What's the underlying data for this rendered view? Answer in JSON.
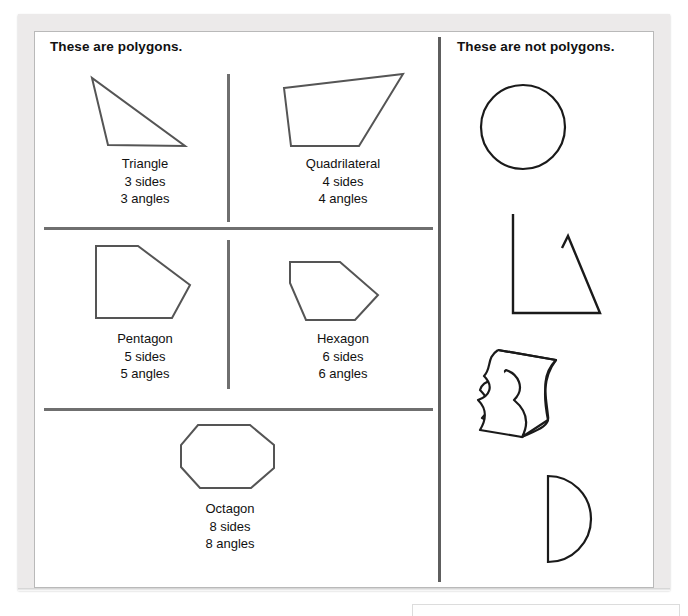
{
  "worksheet": {
    "title_left": "These are polygons.",
    "title_right": "These are not polygons.",
    "stroke_color": "#555555",
    "divider_color": "#6f6f6f",
    "text_color": "#111111",
    "background_color": "#ffffff",
    "mat_color": "#eceaea"
  },
  "polygons": [
    {
      "id": "triangle",
      "name": "Triangle",
      "sides_text": "3 sides",
      "angles_text": "3 angles",
      "sides": 3,
      "angles": 3,
      "shape_type": "triangle"
    },
    {
      "id": "quadrilateral",
      "name": "Quadrilateral",
      "sides_text": "4 sides",
      "angles_text": "4 angles",
      "sides": 4,
      "angles": 4,
      "shape_type": "quadrilateral"
    },
    {
      "id": "pentagon",
      "name": "Pentagon",
      "sides_text": "5 sides",
      "angles_text": "5 angles",
      "sides": 5,
      "angles": 5,
      "shape_type": "pentagon"
    },
    {
      "id": "hexagon",
      "name": "Hexagon",
      "sides_text": "6 sides",
      "angles_text": "6 angles",
      "sides": 6,
      "angles": 6,
      "shape_type": "hexagon"
    },
    {
      "id": "octagon",
      "name": "Octagon",
      "sides_text": "8 sides",
      "angles_text": "8 angles",
      "sides": 8,
      "angles": 8,
      "shape_type": "octagon"
    }
  ],
  "non_polygons": [
    {
      "id": "circle",
      "shape_type": "circle"
    },
    {
      "id": "open-triangle",
      "shape_type": "open-figure"
    },
    {
      "id": "wavy",
      "shape_type": "curved-closed-figure"
    },
    {
      "id": "half-disc",
      "shape_type": "half-disc"
    }
  ]
}
